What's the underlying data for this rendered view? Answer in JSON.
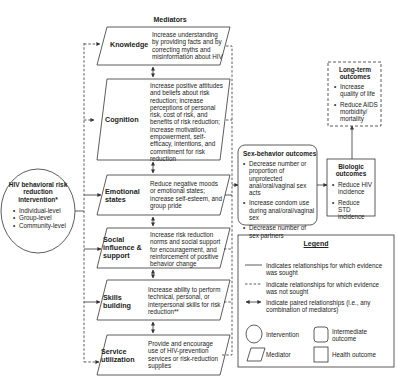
{
  "mediators": {
    "title": "Mediators",
    "items": [
      {
        "label": "Knowledge",
        "desc": "Increase understanding by providing facts and by correcting myths and misinformation about HIV"
      },
      {
        "label": "Cognition",
        "desc": "Increase positive attitudes and beliefs about risk reduction; increase perceptions of personal risk, cost of risk, and benefits of risk reduction; increase motivation, empowerment, self-efficacy, intentions, and  commitment for risk reduction"
      },
      {
        "label": "Emotional states",
        "desc": "Reduce negative moods or emotional states; increase self-esteem, and group pride"
      },
      {
        "label": "Social influence & support",
        "desc": "Increase risk reduction norms and social support for encouragement, and reinforcement of positive behavior change"
      },
      {
        "label": "Skills building",
        "desc": "Increase ability to perform technical, personal, or interpersonal skills for risk reduction**"
      },
      {
        "label": "Service utilization",
        "desc": "Provide and encourage use of HIV-prevention services or risk-reduction supplies"
      }
    ]
  },
  "intervention": {
    "title": "HIV behavioral risk reduction intervention*",
    "items": [
      "Individual-level",
      "Group-level",
      "Community-level"
    ]
  },
  "sex_behavior": {
    "title": "Sex-behavior outcomes",
    "items": [
      "Decrease number or proportion of unprotected anal/oral/vaginal sex acts",
      "Increase condom use during anal/oral/vaginal sex",
      "Decrease number of sex partners"
    ]
  },
  "biologic": {
    "title": "Biologic outcomes",
    "items": [
      "Reduce HIV incidence",
      "Reduce STD incidence"
    ]
  },
  "long_term": {
    "title": "Long-term outcomes",
    "items": [
      "Increase quality of life",
      "Reduce AIDS morbidity/ mortality"
    ]
  },
  "legend": {
    "title": "Legend",
    "solid": "Indicates relationships for which evidence was sought",
    "dashed": "Indicate relationships for which evidence was not sought",
    "paired": "Indicate paired relationships (i.e., any combination of mediators)",
    "intervention": "Intervention",
    "intermediate": "Intermediate outcome",
    "mediator": "Mediator",
    "health": "Health outcome"
  }
}
